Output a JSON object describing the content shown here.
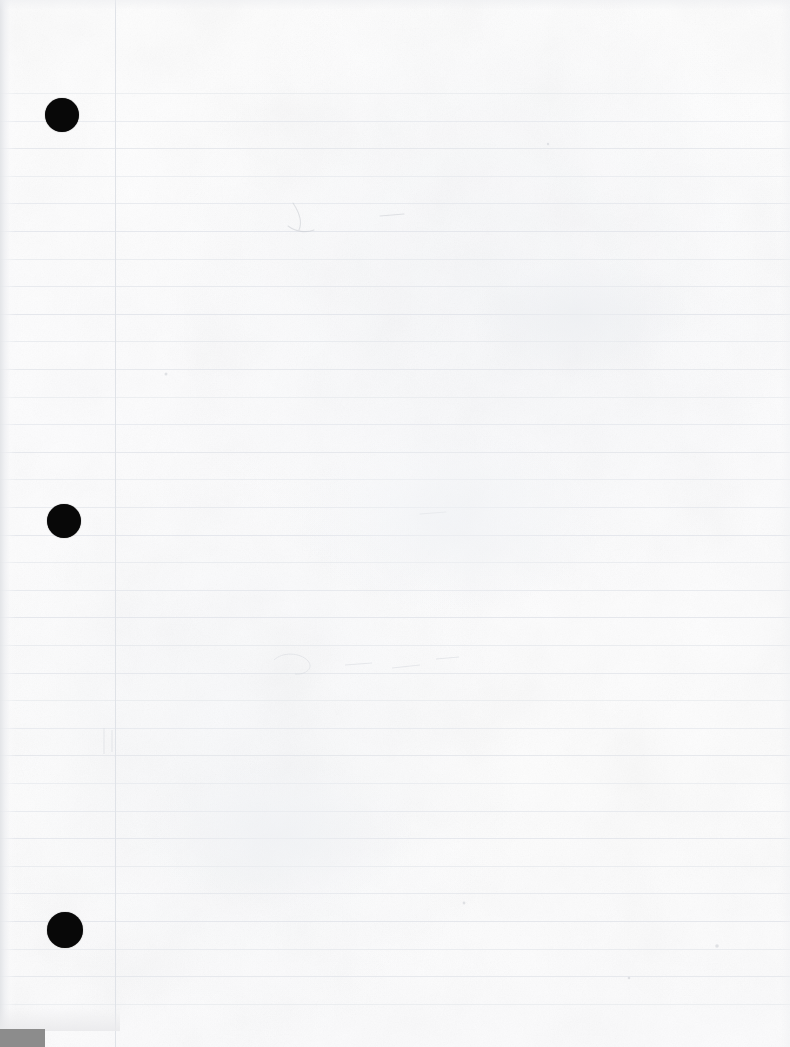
{
  "document": {
    "kind": "scanned-notebook-page",
    "title": "Blank lined notebook page (scan)",
    "text_content": "",
    "page_width": 790,
    "page_height": 1047
  },
  "colors": {
    "paper": "#fdfdfd",
    "ruled_line": "#e2e5ea",
    "margin_line": "#e0e3e8",
    "hole_punch": "#080808",
    "scanner_bar": "#8c8c8c",
    "edge_shadow": "#e2e4e7"
  },
  "paper": {
    "ruling": {
      "first_line_y": 93,
      "line_spacing": 27.6,
      "line_count": 34,
      "line_thickness": 1,
      "line_left": 0,
      "line_right": 790
    },
    "margin_rule": {
      "x": 115,
      "top": 0,
      "bottom": 1047
    },
    "hole_punches": [
      {
        "label": "top-hole",
        "cx": 62,
        "cy": 115,
        "r": 17
      },
      {
        "label": "middle-hole",
        "cx": 64,
        "cy": 521,
        "r": 17
      },
      {
        "label": "bottom-hole",
        "cx": 65,
        "cy": 930,
        "r": 18
      }
    ],
    "scanner_bar": {
      "x": 0,
      "y": 1029,
      "width": 45,
      "height": 18
    }
  },
  "marks": [
    {
      "label": "pencil-stroke-upper",
      "x": 290,
      "y": 205,
      "width": 22,
      "height": 26
    },
    {
      "label": "faint-dash-upper-right",
      "x": 378,
      "y": 214,
      "width": 30,
      "height": 4
    },
    {
      "label": "faint-dash-mid-left",
      "x": 418,
      "y": 512,
      "width": 28,
      "height": 4
    },
    {
      "label": "ghost-blob-mid",
      "x": 272,
      "y": 655,
      "width": 46,
      "height": 20
    },
    {
      "label": "ghost-streak-mid",
      "x": 340,
      "y": 660,
      "width": 120,
      "height": 12
    },
    {
      "label": "speck-lower-right",
      "x": 716,
      "y": 944,
      "width": 3,
      "height": 5
    },
    {
      "label": "speck-lower-centre",
      "x": 463,
      "y": 902,
      "width": 3,
      "height": 3
    },
    {
      "label": "speck-mid-right",
      "x": 628,
      "y": 977,
      "width": 3,
      "height": 3
    }
  ]
}
